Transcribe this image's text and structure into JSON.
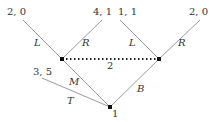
{
  "tree": {
    "root": {
      "player_label": "1"
    },
    "info_set": {
      "player_label": "2"
    },
    "actions": {
      "T": "T",
      "M": "M",
      "B": "B",
      "left_L": "L",
      "left_R": "R",
      "right_L": "L",
      "right_R": "R"
    },
    "payoffs": {
      "T": "3, 5",
      "M_L": "2, 0",
      "M_R": "4, 1",
      "B_L": "1, 1",
      "B_R": "2, 0"
    }
  }
}
